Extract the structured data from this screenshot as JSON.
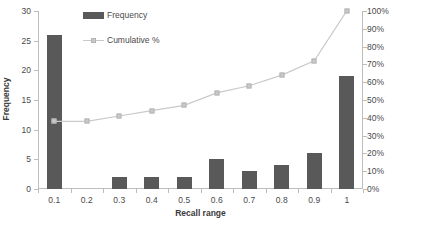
{
  "chart_data": {
    "type": "bar",
    "title": "",
    "xlabel": "Recall range",
    "ylabel": "Frequency",
    "y2label": "",
    "categories": [
      "0.1",
      "0.2",
      "0.3",
      "0.4",
      "0.5",
      "0.6",
      "0.7",
      "0.8",
      "0.9",
      "1"
    ],
    "series": [
      {
        "name": "Frequency",
        "type": "bar",
        "axis": "left",
        "color": "#595959",
        "values": [
          26,
          0,
          2,
          2,
          2,
          5,
          3,
          4,
          6,
          19
        ]
      },
      {
        "name": "Cumulative %",
        "type": "line",
        "axis": "right",
        "color": "#c9c9c9",
        "values": [
          38,
          38,
          41,
          44,
          47,
          54,
          58,
          64,
          72,
          100
        ]
      }
    ],
    "ylim": [
      0,
      30
    ],
    "y2lim": [
      0,
      100
    ],
    "yticks": [
      "0",
      "5",
      "10",
      "15",
      "20",
      "25",
      "30"
    ],
    "ytick_values": [
      0,
      5,
      10,
      15,
      20,
      25,
      30
    ],
    "y2ticks": [
      "0%",
      "10%",
      "20%",
      "30%",
      "40%",
      "50%",
      "60%",
      "70%",
      "80%",
      "90%",
      "100%"
    ],
    "y2tick_values": [
      0,
      10,
      20,
      30,
      40,
      50,
      60,
      70,
      80,
      90,
      100
    ],
    "grid": false,
    "legend_position": "top-left",
    "legend": [
      "Frequency",
      "Cumulative %"
    ]
  },
  "colors": {
    "bar": "#595959",
    "line": "#c9c9c9",
    "axis": "#bdbdbd",
    "text": "#4a4a4a",
    "background": "#ffffff"
  }
}
